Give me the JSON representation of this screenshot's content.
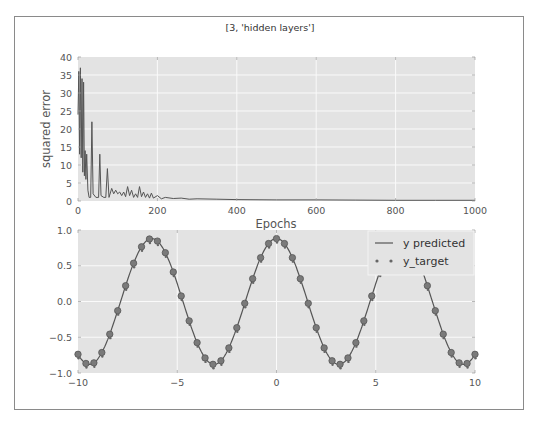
{
  "figure": {
    "title": "[3, 'hidden layers']"
  },
  "chart_data": [
    {
      "type": "line",
      "title": "[3, 'hidden layers']",
      "xlabel": "Epochs",
      "ylabel": "squared error",
      "xlim": [
        0,
        1000
      ],
      "ylim": [
        0,
        40
      ],
      "xticks": [
        "0",
        "200",
        "400",
        "600",
        "800",
        "1000"
      ],
      "yticks": [
        "0",
        "5",
        "10",
        "15",
        "20",
        "25",
        "30",
        "35",
        "40"
      ],
      "grid": true,
      "series": [
        {
          "name": "squared error",
          "color": "#555555",
          "x": [
            0,
            2,
            4,
            6,
            8,
            10,
            12,
            14,
            16,
            18,
            20,
            22,
            25,
            28,
            32,
            35,
            38,
            45,
            52,
            55,
            58,
            65,
            70,
            74,
            78,
            85,
            90,
            95,
            100,
            105,
            110,
            115,
            120,
            125,
            130,
            135,
            140,
            145,
            150,
            155,
            160,
            165,
            170,
            175,
            180,
            185,
            190,
            200,
            210,
            220,
            240,
            260,
            280,
            300,
            350,
            400,
            500,
            600,
            700,
            800,
            900,
            1000
          ],
          "values": [
            24,
            36,
            13,
            37,
            12,
            34,
            8,
            33,
            7,
            14,
            6,
            13,
            3,
            1,
            1,
            22,
            2,
            1,
            1,
            13,
            1.5,
            1,
            1,
            9,
            1,
            3.5,
            2,
            3,
            2,
            2.5,
            1.5,
            2.5,
            1.2,
            4,
            1.5,
            3,
            1,
            2,
            1,
            4,
            1.2,
            2.5,
            1,
            2,
            0.8,
            2.2,
            0.8,
            1.5,
            0.6,
            1,
            0.7,
            0.8,
            0.5,
            0.6,
            0.5,
            0.4,
            0.3,
            0.3,
            0.25,
            0.2,
            0.2,
            0.2
          ]
        }
      ]
    },
    {
      "type": "line",
      "title": "",
      "xlabel": "",
      "ylabel": "",
      "xlim": [
        -10,
        10
      ],
      "ylim": [
        -1.0,
        1.0
      ],
      "xticks": [
        "−10",
        "−5",
        "0",
        "5",
        "10"
      ],
      "yticks": [
        "−1.0",
        "−0.5",
        "0.0",
        "0.5",
        "1.0"
      ],
      "grid": true,
      "legend": {
        "position": "upper right",
        "entries": [
          "y predicted",
          "y_target"
        ]
      },
      "series": [
        {
          "name": "y predicted",
          "style": "line",
          "color": "#555555",
          "function": "0.88*cos(x)",
          "x_range": [
            -10,
            10
          ]
        },
        {
          "name": "y_target",
          "style": "markers",
          "color": "#666666",
          "function": "0.88*cos(x)",
          "x_step": 0.4,
          "x_range": [
            -10,
            10
          ]
        }
      ]
    }
  ],
  "top": {
    "xlabel": "Epochs",
    "ylabel": "squared error",
    "xticks": [
      "0",
      "200",
      "400",
      "600",
      "800",
      "1000"
    ],
    "yticks": [
      "0",
      "5",
      "10",
      "15",
      "20",
      "25",
      "30",
      "35",
      "40"
    ]
  },
  "bottom": {
    "xticks": [
      "−10",
      "−5",
      "0",
      "5",
      "10"
    ],
    "yticks": [
      "−1.0",
      "−0.5",
      "0.0",
      "0.5",
      "1.0"
    ],
    "legend": {
      "predicted": "y predicted",
      "target": "y_target"
    }
  }
}
